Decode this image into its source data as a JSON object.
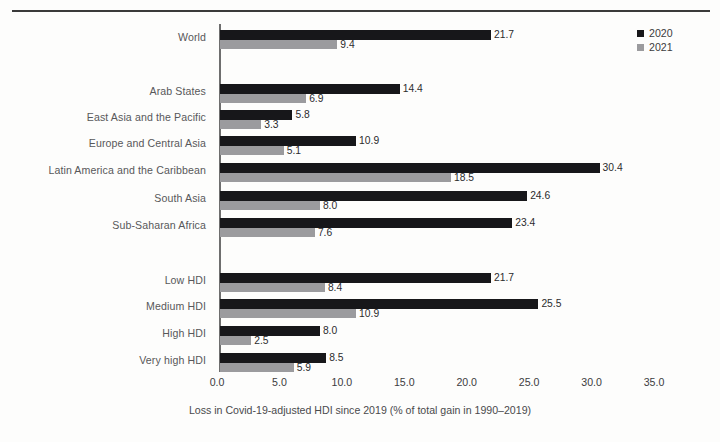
{
  "chart_data": {
    "type": "bar",
    "orientation": "horizontal",
    "title": "",
    "xlabel": "Loss in Covid-19-adjusted HDI since 2019 (% of total gain in 1990–2019)",
    "ylabel": "",
    "xlim": [
      0.0,
      35.0
    ],
    "xticks": [
      "0.0",
      "5.0",
      "10.0",
      "15.0",
      "20.0",
      "25.0",
      "30.0",
      "35.0"
    ],
    "xtick_values": [
      0.0,
      5.0,
      10.0,
      15.0,
      20.0,
      25.0,
      30.0,
      35.0
    ],
    "grid": false,
    "legend_position": "top-right",
    "categories": [
      "World",
      "Arab States",
      "East Asia and the Pacific",
      "Europe and Central Asia",
      "Latin America and the Caribbean",
      "South Asia",
      "Sub-Saharan Africa",
      "Low HDI",
      "Medium HDI",
      "High HDI",
      "Very high HDI"
    ],
    "series": [
      {
        "name": "2020",
        "color": "#17171a",
        "values": [
          21.7,
          14.4,
          5.8,
          10.9,
          30.4,
          24.6,
          23.4,
          21.7,
          25.5,
          8.0,
          8.5
        ],
        "labels": [
          "21.7",
          "14.4",
          "5.8",
          "10.9",
          "30.4",
          "24.6",
          "23.4",
          "21.7",
          "25.5",
          "8.0",
          "8.5"
        ]
      },
      {
        "name": "2021",
        "color": "#9b9b9e",
        "values": [
          9.4,
          6.9,
          3.3,
          5.1,
          18.5,
          8.0,
          7.6,
          8.4,
          10.9,
          2.5,
          5.9
        ],
        "labels": [
          "9.4",
          "6.9",
          "3.3",
          "5.1",
          "18.5",
          "8.0",
          "7.6",
          "8.4",
          "10.9",
          "2.5",
          "5.9"
        ]
      }
    ]
  },
  "legend": {
    "items": [
      {
        "label": "2020",
        "color": "#17171a"
      },
      {
        "label": "2021",
        "color": "#9b9b9e"
      }
    ]
  },
  "colors": {
    "series_2020": "#17171a",
    "series_2021": "#9b9b9e",
    "axis": "#6e6e6e",
    "rule": "#3a3a3a",
    "label_text": "#58585a",
    "background": "#fdfdfc"
  }
}
